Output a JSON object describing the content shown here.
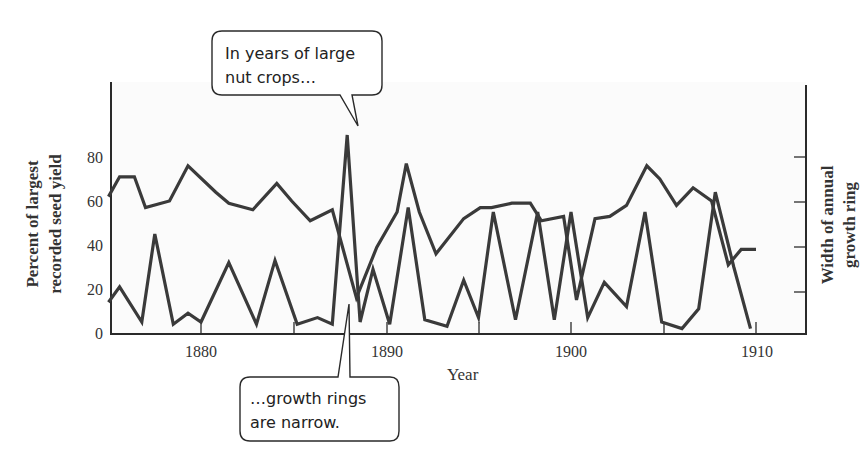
{
  "chart_data": {
    "type": "line",
    "title": "",
    "xlabel": "Year",
    "ylabel": "Percent of largest recorded seed yield",
    "ylabel_lines": [
      "Percent of largest",
      "recorded seed yield"
    ],
    "y2label": "Width of annual growth ring",
    "y2label_lines": [
      "Width of annual",
      "growth ring"
    ],
    "xlim": [
      1875,
      1912.7
    ],
    "ylim": [
      0,
      100
    ],
    "x_ticks": [
      1880,
      1885,
      1890,
      1895,
      1900,
      1905,
      1910
    ],
    "x_tick_labels": [
      "1880",
      "1890",
      "1900",
      "1910"
    ],
    "y_ticks": [
      0,
      20,
      40,
      60,
      80
    ],
    "y_tick_labels": [
      "0",
      "20",
      "40",
      "60",
      "80"
    ],
    "y2_ticks": [
      20,
      40,
      60,
      80
    ],
    "y2_tick_labels": [],
    "grid": false,
    "legend": null,
    "series": [
      {
        "name": "Seed yield (percent of largest recorded)",
        "axis": "left",
        "x": [
          1875,
          1875.6,
          1876.8,
          1877.5,
          1878.5,
          1879.3,
          1880.0,
          1881.5,
          1883.0,
          1884.0,
          1885.2,
          1886.3,
          1887.1,
          1887.9,
          1888.6,
          1889.3,
          1890.2,
          1891.2,
          1892.1,
          1893.3,
          1894.2,
          1895.0,
          1895.8,
          1897.0,
          1898.2,
          1899.1,
          1900.0,
          1900.9,
          1901.8,
          1903.0,
          1904.0,
          1904.9,
          1906.0,
          1906.9,
          1907.8,
          1908.8,
          1909.7
        ],
        "values": [
          14,
          21,
          5,
          45,
          4,
          9,
          5,
          32,
          4,
          33,
          4,
          7,
          4,
          90,
          5,
          29,
          4,
          57,
          6,
          3,
          24,
          7,
          55,
          6,
          55,
          6,
          55,
          7,
          23,
          12,
          55,
          5,
          2,
          11,
          64,
          30,
          2
        ],
        "color": "#3a3a3a"
      },
      {
        "name": "Width of annual growth ring",
        "axis": "right",
        "x": [
          1875,
          1875.6,
          1876.4,
          1877.0,
          1878.3,
          1879.3,
          1880.8,
          1881.5,
          1882.8,
          1884.1,
          1884.9,
          1885.9,
          1887.1,
          1888.4,
          1889.5,
          1890.6,
          1891.1,
          1891.8,
          1892.7,
          1894.2,
          1895.1,
          1895.7,
          1896.8,
          1897.8,
          1898.4,
          1899.6,
          1900.3,
          1901.3,
          1902.1,
          1903.0,
          1904.1,
          1904.8,
          1905.7,
          1906.6,
          1907.6,
          1908.5,
          1909.2,
          1910.0
        ],
        "values": [
          62,
          71,
          71,
          57,
          60,
          76,
          64,
          59,
          56,
          68,
          60,
          51,
          56,
          16,
          39,
          55,
          77,
          55,
          36,
          52,
          57,
          57,
          59,
          59,
          51,
          53,
          15,
          52,
          53,
          58,
          76,
          70,
          58,
          66,
          60,
          31,
          38,
          38
        ],
        "color": "#3a3a3a"
      }
    ],
    "annotations": [
      {
        "text_lines": [
          "In years of large",
          "nut crops…"
        ],
        "points_to": {
          "x": 1888.5,
          "series": "Seed yield",
          "value": 90
        }
      },
      {
        "text_lines": [
          "…growth rings",
          "are narrow."
        ],
        "points_to": {
          "x": 1888.4,
          "series": "Width of annual growth ring",
          "value": 16
        }
      }
    ]
  },
  "labels": {
    "y_left_line1": "Percent of largest",
    "y_left_line2": "recorded seed yield",
    "y_right_line1": "Width of annual",
    "y_right_line2": "growth ring",
    "x_title": "Year",
    "tick_0": "0",
    "tick_20": "20",
    "tick_40": "40",
    "tick_60": "60",
    "tick_80": "80",
    "year_1880": "1880",
    "year_1890": "1890",
    "year_1900": "1900",
    "year_1910": "1910",
    "callout_top_line1": "In years of large",
    "callout_top_line2": "nut crops…",
    "callout_bottom_line1": "…growth rings",
    "callout_bottom_line2": "are narrow."
  },
  "colors": {
    "line": "#3a3a3a",
    "axis": "#2a2a2a",
    "text": "#333333",
    "plot_background": "#fbfbfb",
    "page_background": "#ffffff"
  }
}
